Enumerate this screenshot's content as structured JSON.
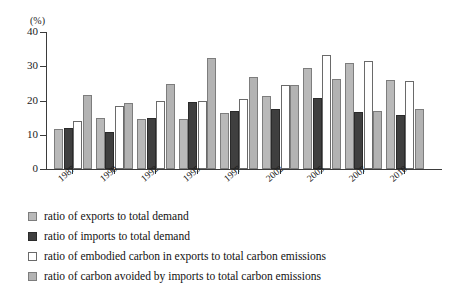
{
  "chart_data": {
    "type": "bar",
    "title": "",
    "xlabel": "",
    "ylabel": "(%)",
    "ylim": [
      0,
      40
    ],
    "yticks": [
      0,
      10,
      20,
      30,
      40
    ],
    "grid": false,
    "legend_position": "below",
    "categories": [
      "1987",
      "1990",
      "1992",
      "1995",
      "1997",
      "2002",
      "2005",
      "2007",
      "2010"
    ],
    "series": [
      {
        "name": "ratio of exports to total demand",
        "color": "#b9b9b9",
        "values": [
          11.8,
          14.8,
          14.5,
          14.6,
          16.3,
          21.2,
          29.5,
          31.0,
          26.0
        ]
      },
      {
        "name": "ratio of imports to total demand",
        "color": "#3f3f3f",
        "values": [
          11.9,
          10.9,
          15.0,
          19.7,
          16.8,
          17.4,
          20.8,
          16.7,
          15.8
        ]
      },
      {
        "name": "ratio of embodied carbon in exports to total carbon emissions",
        "color": "#ffffff",
        "values": [
          13.9,
          18.3,
          19.8,
          19.8,
          20.5,
          24.6,
          33.2,
          31.4,
          25.7
        ]
      },
      {
        "name": "ratio of carbon avoided by imports to total carbon emissions",
        "color": "#b3b3b3",
        "values": [
          21.6,
          19.4,
          24.9,
          32.5,
          26.8,
          24.4,
          26.3,
          17.0,
          17.6
        ]
      }
    ]
  },
  "axis": {
    "unit": "(%)",
    "tick_labels": [
      "40",
      "30",
      "20",
      "10",
      "0"
    ]
  },
  "legend": {
    "items": [
      {
        "label": "ratio of exports to total demand",
        "swatch": "legend-swatch-exports-demand"
      },
      {
        "label": "ratio of imports to total demand",
        "swatch": "legend-swatch-imports-demand"
      },
      {
        "label": "ratio of embodied carbon in exports to total carbon emissions",
        "swatch": "legend-swatch-embodied-carbon-exports"
      },
      {
        "label": "ratio of carbon avoided by imports to total carbon emissions",
        "swatch": "legend-swatch-carbon-avoided-imports"
      }
    ]
  }
}
